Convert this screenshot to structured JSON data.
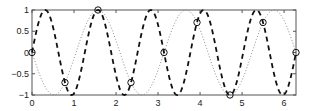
{
  "chart_data": {
    "type": "line",
    "title": "",
    "xlabel": "",
    "ylabel": "",
    "xlim": [
      0,
      6.2832
    ],
    "ylim": [
      -1,
      1
    ],
    "grid": false,
    "legend": null,
    "x_ticks": [
      "0",
      "1",
      "2",
      "3",
      "4",
      "5",
      "6"
    ],
    "y_ticks": [
      "-1",
      "-0.5",
      "0",
      "0.5",
      "1"
    ],
    "series": [
      {
        "name": "sin(5x)",
        "style": "dashed",
        "color": "#000000",
        "function": "sin(5x)"
      },
      {
        "name": "-sin(3x)",
        "style": "dotted",
        "color": "#777777",
        "function": "-sin(3x)"
      },
      {
        "name": "intersections",
        "style": "circle-markers",
        "color": "#000000",
        "x": [
          0,
          0.785,
          1.571,
          2.356,
          3.142,
          3.927,
          4.712,
          5.498,
          6.283
        ],
        "y": [
          0,
          -0.707,
          1,
          -0.707,
          0,
          0.707,
          -1,
          0.707,
          0
        ]
      }
    ]
  }
}
